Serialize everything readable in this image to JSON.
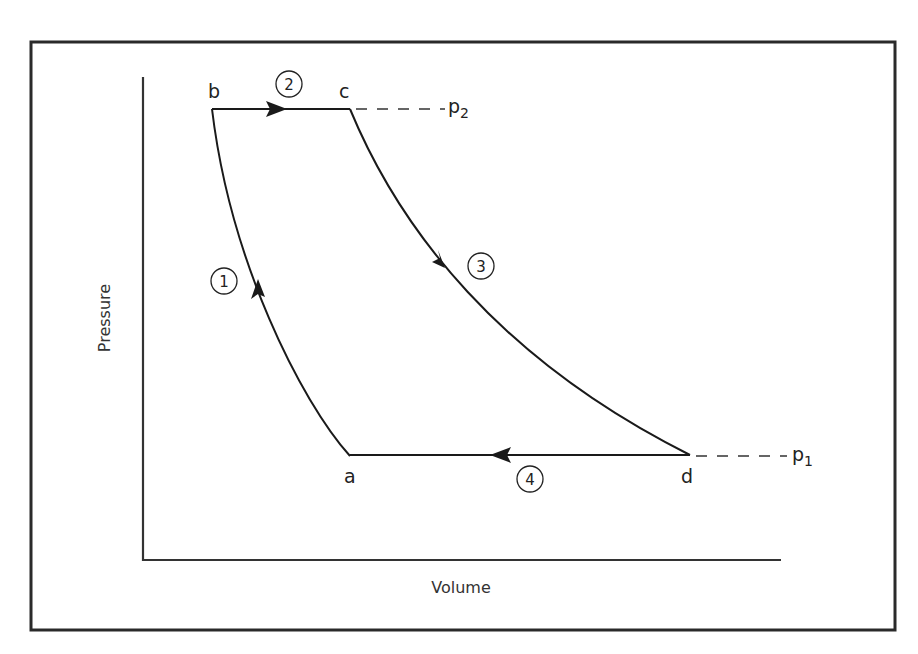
{
  "diagram": {
    "type": "pressure-volume cycle",
    "axes": {
      "x_label": "Volume",
      "y_label": "Pressure"
    },
    "points": {
      "a": "a",
      "b": "b",
      "c": "c",
      "d": "d"
    },
    "pressure_levels": {
      "high": {
        "base": "p",
        "sub": "2"
      },
      "low": {
        "base": "p",
        "sub": "1"
      }
    },
    "steps": [
      {
        "num": "1",
        "from": "a",
        "to": "b"
      },
      {
        "num": "2",
        "from": "b",
        "to": "c"
      },
      {
        "num": "3",
        "from": "c",
        "to": "d"
      },
      {
        "num": "4",
        "from": "d",
        "to": "a"
      }
    ],
    "colors": {
      "line": "#1a1a1a",
      "background": "#ffffff"
    }
  }
}
